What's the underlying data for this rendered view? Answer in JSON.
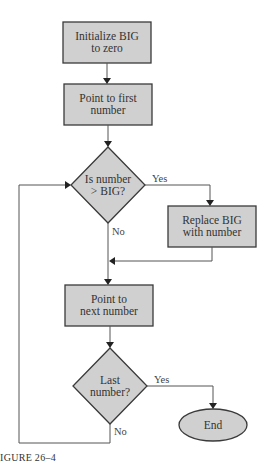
{
  "flowchart": {
    "nodes": [
      {
        "id": "init",
        "type": "process",
        "lines": [
          "Initialize BIG",
          "to zero"
        ]
      },
      {
        "id": "point_first",
        "type": "process",
        "lines": [
          "Point to first",
          "number"
        ]
      },
      {
        "id": "compare",
        "type": "decision",
        "lines": [
          "Is number",
          "> BIG?"
        ]
      },
      {
        "id": "replace",
        "type": "process",
        "lines": [
          "Replace BIG",
          "with number"
        ]
      },
      {
        "id": "point_next",
        "type": "process",
        "lines": [
          "Point to",
          "next number"
        ]
      },
      {
        "id": "last",
        "type": "decision",
        "lines": [
          "Last",
          "number?"
        ]
      },
      {
        "id": "end",
        "type": "terminal",
        "lines": [
          "End"
        ]
      }
    ],
    "edges": [
      {
        "from": "init",
        "to": "point_first",
        "label": ""
      },
      {
        "from": "point_first",
        "to": "compare",
        "label": ""
      },
      {
        "from": "compare",
        "to": "replace",
        "label": "Yes"
      },
      {
        "from": "compare",
        "to": "point_next",
        "label": "No"
      },
      {
        "from": "replace",
        "to": "point_next",
        "label": ""
      },
      {
        "from": "point_next",
        "to": "last",
        "label": ""
      },
      {
        "from": "last",
        "to": "end",
        "label": "Yes"
      },
      {
        "from": "last",
        "to": "compare",
        "label": "No"
      }
    ],
    "edge_labels": {
      "compare_yes": "Yes",
      "compare_no": "No",
      "last_yes": "Yes",
      "last_no": "No"
    }
  },
  "caption": "IGURE 26–4",
  "colors": {
    "shape_fill": "#d0d0d0",
    "shape_stroke": "#3a3a3a",
    "line": "#555555"
  }
}
